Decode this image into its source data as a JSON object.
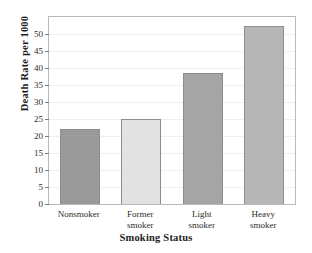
{
  "chart_data": {
    "type": "bar",
    "title": "",
    "xlabel": "Smoking Status",
    "ylabel": "Death Rate per 1000",
    "categories": [
      "Nonsmoker",
      "Former smoker",
      "Light smoker",
      "Heavy smoker"
    ],
    "category_lines": [
      [
        "Nonsmoker"
      ],
      [
        "Former",
        "smoker"
      ],
      [
        "Light",
        "smoker"
      ],
      [
        "Heavy",
        "smoker"
      ]
    ],
    "values": [
      22,
      25,
      38.5,
      52.5
    ],
    "ylim": [
      0,
      55
    ],
    "yticks": [
      0,
      5,
      10,
      15,
      20,
      25,
      30,
      35,
      40,
      45,
      50
    ],
    "ytick_labels": [
      "0",
      "5",
      "10",
      "15",
      "20",
      "25",
      "30",
      "35",
      "40",
      "45",
      "50"
    ],
    "grid": true,
    "legend": false,
    "bar_colors": [
      "#9a9a9a",
      "#e2e2e2",
      "#a5a5a5",
      "#b6b6b6"
    ],
    "bar_border_color": "#8d8d8d",
    "frame_color": "#b9b9b9",
    "gridline_color": "#f0eeee",
    "background": "#ffffff"
  }
}
